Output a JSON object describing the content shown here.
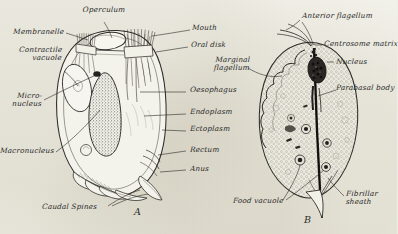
{
  "plate": {
    "title": "Protozoa comparative plate",
    "background_color": "#efeee6",
    "ink_color": "#2b2b2b"
  },
  "figures": [
    {
      "id": "A",
      "caption": "A",
      "organism_type": "ciliate",
      "description": "Ciliate protozoan with operculum, oral disk, ciliary membranelles, macronucleus and caudal spines"
    },
    {
      "id": "B",
      "caption": "B",
      "organism_type": "flagellate",
      "description": "Flagellate protozoan with anterior flagellum, axostyle, nucleus and food vacuoles"
    }
  ],
  "labels_figure_a": [
    {
      "key": "operculum",
      "text": "Operculum"
    },
    {
      "key": "mouth",
      "text": "Mouth"
    },
    {
      "key": "membranelle",
      "text": "Membranelle"
    },
    {
      "key": "oral_disk",
      "text": "Oral disk"
    },
    {
      "key": "contractile_vacuole",
      "text": "Contractile\nvacuole"
    },
    {
      "key": "oesophagus",
      "text": "Oesophagus"
    },
    {
      "key": "micronucleus",
      "text": "Micro-\nnucleus"
    },
    {
      "key": "endoplasm",
      "text": "Endoplasm"
    },
    {
      "key": "ectoplasm",
      "text": "Ectoplasm"
    },
    {
      "key": "macronucleus",
      "text": "Macronucleus"
    },
    {
      "key": "rectum",
      "text": "Rectum"
    },
    {
      "key": "anus",
      "text": "Anus"
    },
    {
      "key": "caudal_spines",
      "text": "Caudal Spines"
    }
  ],
  "labels_figure_b": [
    {
      "key": "anterior_flagellum",
      "text": "Anterior flagellum"
    },
    {
      "key": "centrosome_matrix",
      "text": "Centrosome matrix"
    },
    {
      "key": "marginal_flagellum",
      "text": "Marginal\nflagellum"
    },
    {
      "key": "nucleus",
      "text": "Nucleus"
    },
    {
      "key": "parabasal_body",
      "text": "Parabasal body"
    },
    {
      "key": "food_vacuole",
      "text": "Food vacuole"
    },
    {
      "key": "fibrillar_sheath",
      "text": "Fibrillar\nsheath"
    }
  ]
}
